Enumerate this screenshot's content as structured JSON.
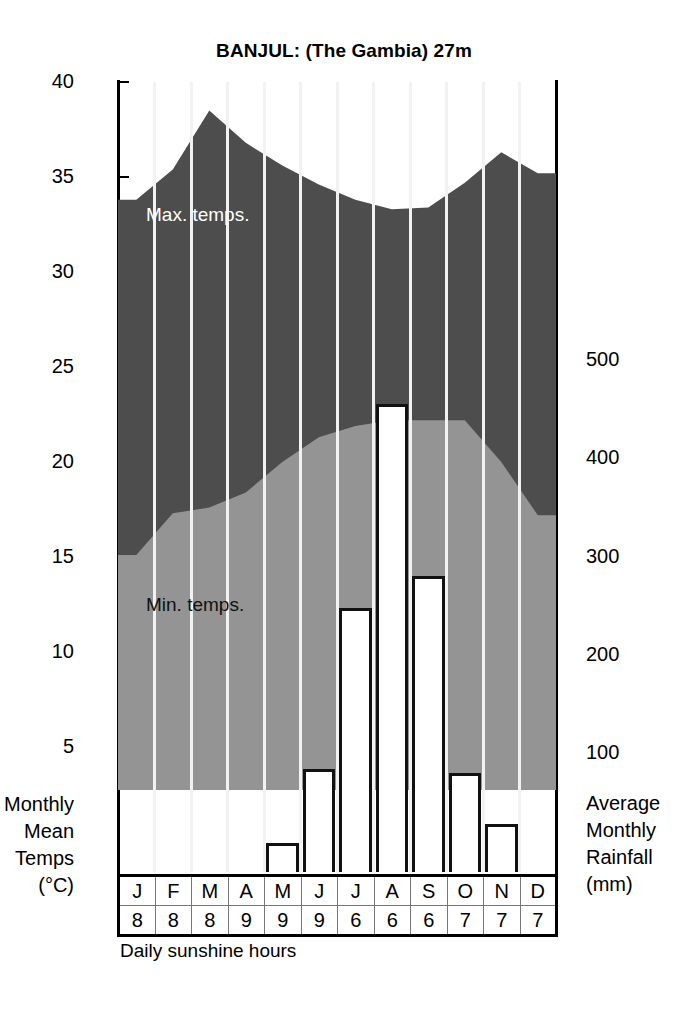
{
  "title": "BANJUL: (The Gambia) 27m",
  "left_axis": {
    "caption_lines": [
      "Monthly",
      "Mean",
      "Temps",
      "(°C)"
    ],
    "ticks": [
      40,
      35,
      30,
      25,
      20,
      15,
      10,
      5
    ]
  },
  "right_axis": {
    "caption_lines": [
      "Average",
      "Monthly",
      "Rainfall",
      "(mm)"
    ],
    "ticks": [
      500,
      400,
      300,
      200,
      100
    ]
  },
  "series_labels": {
    "max": "Max. temps.",
    "min": "Min. temps."
  },
  "table": {
    "months_header": "months",
    "sunshine_header": "daily sunshine hours"
  },
  "footnote": "Daily sunshine hours",
  "colors": {
    "max_band": "#4d4d4d",
    "min_band": "#949494",
    "bar_fill": "#ffffff",
    "bar_stroke": "#111111",
    "guide": "#f2f2f2",
    "axis": "#000000",
    "max_label_text": "#ffffff",
    "min_label_text": "#111111"
  },
  "chart_data": {
    "type": "area",
    "title": "BANJUL: (The Gambia) 27m",
    "xlabel": "",
    "ylabel": "Monthly Mean Temps (°C)",
    "y2label": "Average Monthly Rainfall (mm)",
    "categories": [
      "J",
      "F",
      "M",
      "A",
      "M",
      "J",
      "J",
      "A",
      "S",
      "O",
      "N",
      "D"
    ],
    "ylim": [
      -3,
      40
    ],
    "y2lim": [
      0,
      560
    ],
    "grid": false,
    "legend": "in-plot labels",
    "series": [
      {
        "name": "Max. temps.",
        "type": "area",
        "unit": "°C",
        "values": [
          33.8,
          35.4,
          38.5,
          36.8,
          35.6,
          34.6,
          33.8,
          33.3,
          33.4,
          34.7,
          36.3,
          35.2
        ]
      },
      {
        "name": "Min. temps.",
        "type": "area",
        "unit": "°C",
        "values": [
          15.1,
          17.3,
          17.6,
          18.4,
          20.0,
          21.3,
          21.9,
          22.2,
          22.2,
          22.2,
          20.0,
          17.2
        ]
      },
      {
        "name": "Average Monthly Rainfall",
        "type": "bar",
        "unit": "mm",
        "values": [
          0,
          0,
          0,
          0,
          8,
          84,
          248,
          455,
          280,
          80,
          28,
          0
        ]
      },
      {
        "name": "Daily sunshine hours",
        "type": "table",
        "unit": "hours",
        "values": [
          8,
          8,
          8,
          9,
          9,
          9,
          6,
          6,
          6,
          7,
          7,
          7
        ]
      }
    ]
  }
}
